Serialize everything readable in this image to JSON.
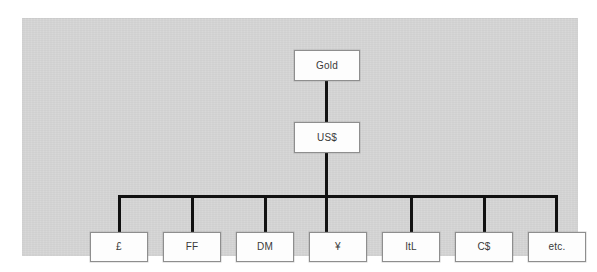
{
  "diagram": {
    "type": "hierarchy-tree",
    "orientation": "top-down",
    "panel_color": "#d4d4d4",
    "box_fill": "#fdfdfd",
    "box_border": "#8e8e8e",
    "connector_color": "#111111",
    "levels": [
      {
        "level": 0,
        "nodes": [
          {
            "id": "gold",
            "label": "Gold"
          }
        ]
      },
      {
        "level": 1,
        "nodes": [
          {
            "id": "usd",
            "label": "US$"
          }
        ]
      },
      {
        "level": 2,
        "nodes": [
          {
            "id": "gbp",
            "label": "£"
          },
          {
            "id": "ff",
            "label": "FF"
          },
          {
            "id": "dm",
            "label": "DM"
          },
          {
            "id": "jpy",
            "label": "¥"
          },
          {
            "id": "itl",
            "label": "ItL"
          },
          {
            "id": "cad",
            "label": "C$"
          },
          {
            "id": "etc",
            "label": "etc."
          }
        ]
      }
    ],
    "edges": [
      {
        "from": "gold",
        "to": "usd"
      },
      {
        "from": "usd",
        "to": "gbp"
      },
      {
        "from": "usd",
        "to": "ff"
      },
      {
        "from": "usd",
        "to": "dm"
      },
      {
        "from": "usd",
        "to": "jpy"
      },
      {
        "from": "usd",
        "to": "itl"
      },
      {
        "from": "usd",
        "to": "cad"
      },
      {
        "from": "usd",
        "to": "etc"
      }
    ]
  }
}
